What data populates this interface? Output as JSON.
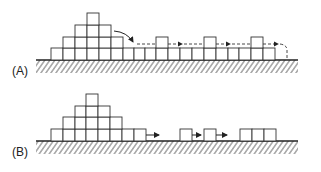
{
  "panels": [
    {
      "label": "(A)",
      "description": "Pyramid of blocks with flattened base; a block slides off the top and hops along the surface (dashed path with arrows)"
    },
    {
      "label": "(B)",
      "description": "Pyramid of blocks with individual blocks detaching and moving right along the surface"
    }
  ],
  "colors": {
    "stroke": "#333333",
    "background": "#ffffff"
  }
}
